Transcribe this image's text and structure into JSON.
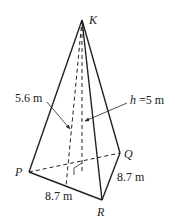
{
  "figure": {
    "type": "square pyramid",
    "vertices": {
      "apex": {
        "name": "K",
        "x": 82,
        "y": 20
      },
      "P": {
        "name": "P",
        "x": 29,
        "y": 172
      },
      "Q": {
        "name": "Q",
        "x": 120,
        "y": 153
      },
      "R": {
        "name": "R",
        "x": 102,
        "y": 200
      },
      "back": {
        "x": 47,
        "y": 125
      }
    },
    "labels": {
      "apex": "K",
      "p": "P",
      "q": "Q",
      "r": "R",
      "slant_height": "5.6 m",
      "height_prefix": "h",
      "height_value": " =5 m",
      "base_edge_pr": "8.7 m",
      "base_edge_qr": "8.7 m"
    },
    "colors": {
      "stroke": "#222222",
      "background": "#ffffff"
    }
  }
}
